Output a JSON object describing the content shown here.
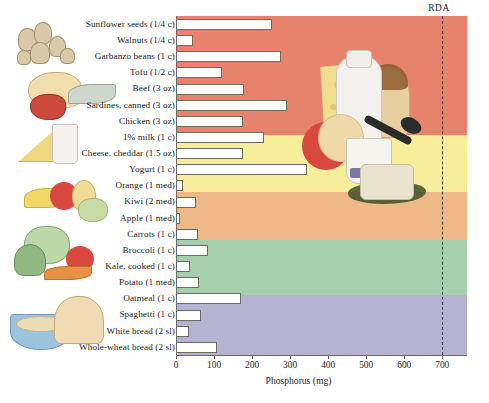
{
  "chart_data": {
    "type": "bar",
    "title": "",
    "xlabel": "Phosphorus (mg)",
    "ylabel": "",
    "orientation": "horizontal",
    "xlim": [
      0,
      765
    ],
    "xticks": [
      0,
      100,
      200,
      300,
      400,
      500,
      600,
      700
    ],
    "grid": false,
    "legend": "none",
    "annotations": [
      {
        "label": "RDA",
        "value": 700,
        "style": "vertical dashed line"
      }
    ],
    "categories": [
      "Sunflower seeds (1/4 c)",
      "Walnuts (1/4 c)",
      "Garbanzo beans (1 c)",
      "Tofu (1/2 c)",
      "Beef (3 oz)",
      "Sardines, canned (3 oz)",
      "Chicken (3 oz)",
      "1% milk (1 c)",
      "Cheese, cheddar (1.5 oz)",
      "Yogurt (1 c)",
      "Orange (1 med)",
      "Kiwi (2 med)",
      "Apple (1 med)",
      "Carrots (1 c)",
      "Broccoli (1 c)",
      "Kale, cooked (1 c)",
      "Potato (1 med)",
      "Oatmeal (1 c)",
      "Spaghetti (1 c)",
      "White bread (2 sl)",
      "Whole-wheat bread (2 sl)"
    ],
    "values": [
      253,
      45,
      276,
      120,
      180,
      292,
      176,
      232,
      175,
      345,
      18,
      52,
      10,
      58,
      85,
      36,
      60,
      170,
      67,
      35,
      107
    ],
    "groups": [
      {
        "name": "Protein foods",
        "color": "#e7836c",
        "categories": 6
      },
      {
        "name": "Dairy",
        "color": "#f7ee9c",
        "categories": 4
      },
      {
        "name": "Fruits",
        "color": "#eeb887",
        "categories": 3
      },
      {
        "name": "Vegetables",
        "color": "#a6cfae",
        "categories": 4
      },
      {
        "name": "Grains",
        "color": "#b6b3d2",
        "categories": 4
      }
    ]
  },
  "axis": {
    "x_title": "Phosphorus (mg)",
    "tick_labels": [
      "0",
      "100",
      "200",
      "300",
      "400",
      "500",
      "600",
      "700"
    ]
  },
  "rda": {
    "label": "RDA"
  },
  "figure": {
    "number": ""
  },
  "colors": {
    "band_protein": "#e7836c",
    "band_dairy": "#f7ee9c",
    "band_fruit": "#eeb887",
    "band_veg": "#a6cfae",
    "band_grain": "#b6b3d2",
    "bar_fill": "#ffffff",
    "bar_stroke": "#6d6a5f",
    "rda_line": "#3b3b3b"
  }
}
